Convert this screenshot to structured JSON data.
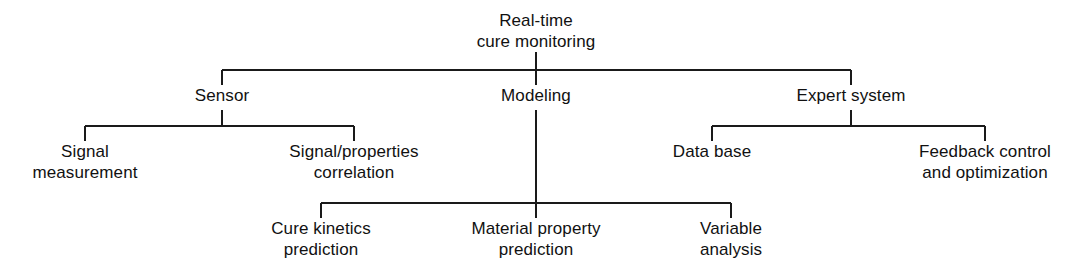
{
  "diagram": {
    "type": "hierarchy-tree",
    "orientation": "top-down",
    "line_color": "#1a1a1a",
    "background_color": "#ffffff",
    "text_color": "#111111",
    "nodes": [
      {
        "id": "root",
        "level": 0,
        "lines": [
          "Real-time",
          "cure monitoring"
        ],
        "x": 536,
        "y": 10
      },
      {
        "id": "sensor",
        "level": 1,
        "parent": "root",
        "lines": [
          "Sensor"
        ],
        "x": 222,
        "y": 85
      },
      {
        "id": "modeling",
        "level": 1,
        "parent": "root",
        "lines": [
          "Modeling"
        ],
        "x": 536,
        "y": 85
      },
      {
        "id": "expert-system",
        "level": 1,
        "parent": "root",
        "lines": [
          "Expert system"
        ],
        "x": 851,
        "y": 85
      },
      {
        "id": "signal-measurement",
        "level": 2,
        "parent": "sensor",
        "lines": [
          "Signal",
          "measurement"
        ],
        "x": 85,
        "y": 141
      },
      {
        "id": "signal-properties-correlation",
        "level": 2,
        "parent": "sensor",
        "lines": [
          "Signal/properties",
          "correlation"
        ],
        "x": 354,
        "y": 141
      },
      {
        "id": "data-base",
        "level": 2,
        "parent": "expert-system",
        "lines": [
          "Data base"
        ],
        "x": 712,
        "y": 141
      },
      {
        "id": "feedback-control-and-optimization",
        "level": 2,
        "parent": "expert-system",
        "lines": [
          "Feedback control",
          "and optimization"
        ],
        "x": 985,
        "y": 141
      },
      {
        "id": "cure-kinetics-prediction",
        "level": 2,
        "parent": "modeling",
        "lines": [
          "Cure kinetics",
          "prediction"
        ],
        "x": 321,
        "y": 218
      },
      {
        "id": "material-property-prediction",
        "level": 2,
        "parent": "modeling",
        "lines": [
          "Material property",
          "prediction"
        ],
        "x": 536,
        "y": 218
      },
      {
        "id": "variable-analysis",
        "level": 2,
        "parent": "modeling",
        "lines": [
          "Variable",
          "analysis"
        ],
        "x": 731,
        "y": 218
      }
    ],
    "connectors": [
      {
        "id": "root-stem",
        "points": "536,52 536,70"
      },
      {
        "id": "level1-bus",
        "points": "222,70 851,70"
      },
      {
        "id": "sensor-drop",
        "points": "222,70 222,85"
      },
      {
        "id": "modeling-drop",
        "points": "536,70 536,85"
      },
      {
        "id": "expert-system-drop",
        "points": "851,70 851,85"
      },
      {
        "id": "sensor-stem",
        "points": "222,110 222,126"
      },
      {
        "id": "sensor-bus",
        "points": "85,126 354,126"
      },
      {
        "id": "signal-measurement-drop",
        "points": "85,126 85,141"
      },
      {
        "id": "signal-properties-drop",
        "points": "354,126 354,141"
      },
      {
        "id": "expert-stem",
        "points": "851,110 851,126"
      },
      {
        "id": "expert-bus",
        "points": "712,126 985,126"
      },
      {
        "id": "data-base-drop",
        "points": "712,126 712,141"
      },
      {
        "id": "feedback-drop",
        "points": "985,126 985,141"
      },
      {
        "id": "modeling-trunk",
        "points": "536,110 536,203"
      },
      {
        "id": "modeling-bus",
        "points": "321,203 731,203"
      },
      {
        "id": "cure-kinetics-drop",
        "points": "321,203 321,218"
      },
      {
        "id": "material-property-drop",
        "points": "536,203 536,218"
      },
      {
        "id": "variable-analysis-drop",
        "points": "731,203 731,218"
      }
    ]
  }
}
